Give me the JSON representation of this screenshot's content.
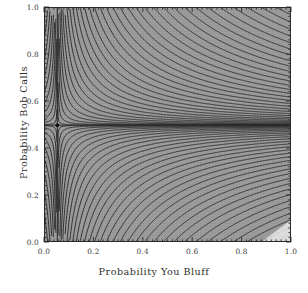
{
  "chart_data": {
    "type": "contour",
    "title": "",
    "xlabel": "Probability You Bluff",
    "ylabel": "Probability Bob Calls",
    "xlim": [
      0.0,
      1.0
    ],
    "ylim": [
      0.0,
      1.0
    ],
    "xticks": [
      "0.0",
      "0.2",
      "0.4",
      "0.6",
      "0.8",
      "1.0"
    ],
    "xtick_values": [
      0.0,
      0.2,
      0.4,
      0.6,
      0.8,
      1.0
    ],
    "yticks": [
      "0.0",
      "0.2",
      "0.4",
      "0.6",
      "0.8",
      "1.0"
    ],
    "ytick_values": [
      0.0,
      0.2,
      0.4,
      0.6,
      0.8,
      1.0
    ],
    "grid": false,
    "legend": false,
    "background_color": "#9a9a9a",
    "contour_color": "#2a2a2a",
    "frame_color": "#2a2a2a",
    "shading": "grayscale",
    "saddle_point": {
      "x": 0.054,
      "y": 0.497,
      "marker": "dot",
      "color": "#111111"
    },
    "contour_levels": [
      -0.45,
      -0.4,
      -0.35,
      -0.3,
      -0.25,
      -0.2,
      -0.16,
      -0.13,
      -0.1,
      -0.08,
      -0.06,
      -0.045,
      -0.03,
      -0.02,
      -0.012,
      -0.006,
      -0.002,
      0.0,
      0.002,
      0.006,
      0.012,
      0.02,
      0.03,
      0.045,
      0.06,
      0.08,
      0.1,
      0.13,
      0.16,
      0.2,
      0.25,
      0.3,
      0.35,
      0.4,
      0.45,
      0.5
    ],
    "asymptote_x": 0.054,
    "asymptote_y": 0.497,
    "note": "Level set f(x,y) = (x - 0.054)*(y - 0.497) style saddle; zero-level contours are the two asymptote lines through the saddle point."
  },
  "axes": {
    "x_title": "Probability You Bluff",
    "y_title": "Probability Bob Calls",
    "x_tick_labels": [
      "0.0",
      "0.2",
      "0.4",
      "0.6",
      "0.8",
      "1.0"
    ],
    "y_tick_labels": [
      "0.0",
      "0.2",
      "0.4",
      "0.6",
      "0.8",
      "1.0"
    ]
  }
}
